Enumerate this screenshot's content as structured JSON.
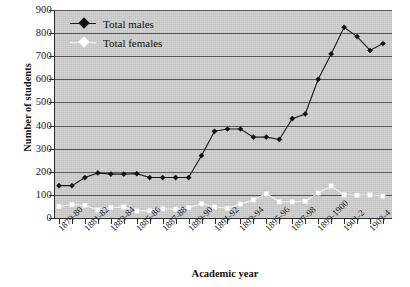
{
  "chart_data": {
    "type": "line",
    "title": "",
    "xlabel": "Academic year",
    "ylabel": "Number of students",
    "ylim": [
      0,
      900
    ],
    "ytick_step": 100,
    "yticks": [
      900,
      800,
      700,
      600,
      500,
      400,
      300,
      200,
      100,
      0
    ],
    "grid": true,
    "legend_position": "top-left",
    "plot_background": "#cfcfcf",
    "categories": [
      "1879-80",
      "1880-81",
      "1881-82",
      "1882-83",
      "1883-84",
      "1884-85",
      "1885-86",
      "1886-87",
      "1887-88",
      "1888-89",
      "1889-90",
      "1890-91",
      "1891-92",
      "1892-93",
      "1893-94",
      "1894-95",
      "1895-96",
      "1896-97",
      "1897-98",
      "1898-99",
      "1899-1900",
      "1900-01",
      "1901-2",
      "1902-3",
      "1903-4",
      "1904-5"
    ],
    "tick_labels_shown": [
      "1879-80",
      "1881-82",
      "1883-84",
      "1885-86",
      "1887-88",
      "1889-90",
      "1891-92",
      "1893-94",
      "1895-96",
      "1897-98",
      "1899-1900",
      "1901-2",
      "1903-4"
    ],
    "series": [
      {
        "name": "Total males",
        "color": "#111111",
        "marker": "filled-diamond",
        "values": [
          140,
          140,
          175,
          195,
          190,
          190,
          192,
          175,
          175,
          175,
          175,
          270,
          375,
          385,
          385,
          350,
          350,
          340,
          430,
          450,
          600,
          710,
          825,
          785,
          725,
          755
        ]
      },
      {
        "name": "Total females",
        "color": "#ffffff",
        "marker": "open-square",
        "values": [
          50,
          58,
          55,
          35,
          45,
          48,
          30,
          32,
          40,
          38,
          45,
          62,
          48,
          42,
          60,
          78,
          105,
          70,
          70,
          72,
          108,
          138,
          100,
          98,
          100,
          95
        ]
      }
    ]
  },
  "legend": {
    "items": [
      {
        "label": "Total males"
      },
      {
        "label": "Total females"
      }
    ]
  },
  "axes": {
    "y_title": "Number of students",
    "x_title": "Academic year"
  }
}
